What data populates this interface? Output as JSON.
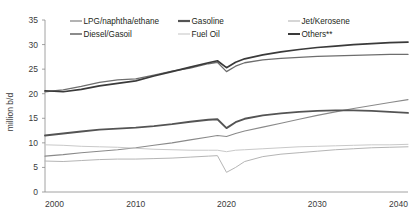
{
  "chart_data": {
    "type": "line",
    "title": "",
    "xlabel": "",
    "ylabel": "million b/d",
    "xlim": [
      2000,
      2040
    ],
    "ylim": [
      0,
      35
    ],
    "ytick_step": 5,
    "yticks": [
      "0",
      "5",
      "10",
      "15",
      "20",
      "25",
      "30",
      "35"
    ],
    "xticks": [
      "2000",
      "2010",
      "2020",
      "2030",
      "2040"
    ],
    "grid": false,
    "legend_position": "top",
    "x": [
      2000,
      2002,
      2004,
      2006,
      2008,
      2010,
      2012,
      2014,
      2016,
      2018,
      2019,
      2020,
      2021,
      2022,
      2024,
      2026,
      2028,
      2030,
      2032,
      2034,
      2036,
      2038,
      2040
    ],
    "series": [
      {
        "name": "LPG/naphtha/ethane",
        "color": "#8a8a8a",
        "width": 1.1,
        "values": [
          7.3,
          7.6,
          8.0,
          8.3,
          8.6,
          9.0,
          9.5,
          10.0,
          10.6,
          11.2,
          11.5,
          11.3,
          11.9,
          12.4,
          13.2,
          14.0,
          14.8,
          15.6,
          16.3,
          17.0,
          17.6,
          18.2,
          18.8
        ]
      },
      {
        "name": "Gasoline",
        "color": "#545454",
        "width": 1.9,
        "values": [
          11.5,
          11.9,
          12.3,
          12.7,
          12.9,
          13.1,
          13.4,
          13.8,
          14.3,
          14.7,
          14.8,
          13.0,
          14.2,
          14.9,
          15.6,
          16.0,
          16.3,
          16.5,
          16.6,
          16.6,
          16.5,
          16.3,
          16.1
        ]
      },
      {
        "name": "Jet/Kerosene",
        "color": "#b5b5b5",
        "width": 1.0,
        "values": [
          6.3,
          6.2,
          6.4,
          6.6,
          6.7,
          6.7,
          6.8,
          6.9,
          7.1,
          7.3,
          7.4,
          4.0,
          5.0,
          6.2,
          7.2,
          7.7,
          8.0,
          8.3,
          8.6,
          8.8,
          9.0,
          9.1,
          9.2
        ]
      },
      {
        "name": "Diesel/Gasoil",
        "color": "#6e6e6e",
        "width": 1.3,
        "values": [
          20.4,
          20.8,
          21.5,
          22.3,
          22.8,
          23.0,
          23.8,
          24.6,
          25.2,
          26.1,
          26.4,
          24.5,
          25.6,
          26.3,
          26.9,
          27.2,
          27.4,
          27.6,
          27.7,
          27.8,
          27.9,
          28.0,
          28.0
        ]
      },
      {
        "name": "Fuel Oil",
        "color": "#c9c9c9",
        "width": 1.0,
        "values": [
          9.6,
          9.5,
          9.3,
          9.2,
          9.1,
          8.9,
          8.7,
          8.6,
          8.5,
          8.5,
          8.5,
          8.2,
          8.5,
          8.6,
          8.8,
          9.0,
          9.2,
          9.3,
          9.4,
          9.5,
          9.6,
          9.6,
          9.7
        ]
      },
      {
        "name": "Others**",
        "color": "#3a3a3a",
        "width": 1.7,
        "values": [
          20.6,
          20.4,
          20.9,
          21.6,
          22.1,
          22.6,
          23.6,
          24.5,
          25.4,
          26.3,
          26.7,
          25.3,
          26.4,
          27.1,
          27.9,
          28.5,
          29.0,
          29.4,
          29.7,
          30.0,
          30.2,
          30.4,
          30.5
        ]
      }
    ]
  },
  "legend": {
    "entries": [
      {
        "label": "LPG/naphtha/ethane",
        "color": "#8a8a8a",
        "width": 1.3,
        "row": 0,
        "col": 0
      },
      {
        "label": "Gasoline",
        "color": "#545454",
        "width": 2.2,
        "row": 0,
        "col": 1
      },
      {
        "label": "Jet/Kerosene",
        "color": "#b5b5b5",
        "width": 1.1,
        "row": 0,
        "col": 2
      },
      {
        "label": "Diesel/Gasoil",
        "color": "#6e6e6e",
        "width": 1.6,
        "row": 1,
        "col": 0
      },
      {
        "label": "Fuel Oil",
        "color": "#c9c9c9",
        "width": 1.1,
        "row": 1,
        "col": 1
      },
      {
        "label": "Others**",
        "color": "#3a3a3a",
        "width": 2.0,
        "row": 1,
        "col": 2
      }
    ]
  }
}
